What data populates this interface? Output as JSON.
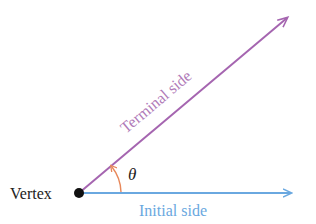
{
  "diagram": {
    "type": "angle-in-standard-position",
    "labels": {
      "vertex": "Vertex",
      "initial_side": "Initial side",
      "terminal_side": "Terminal side",
      "angle": "θ"
    },
    "colors": {
      "initial_side": "#6aa8e0",
      "terminal_side": "#a565b0",
      "angle_arc": "#e8885a",
      "vertex_dot": "#111111",
      "vertex_text": "#222222",
      "initial_text": "#6aa8e0",
      "terminal_text": "#b07ab8"
    }
  }
}
